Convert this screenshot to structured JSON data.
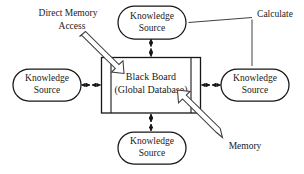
{
  "diagram": {
    "background_color": "#ffffff",
    "stroke_color": "#161616",
    "text_color": "#1a1a1a",
    "board": {
      "line1": "Black Board",
      "line2": "(Global Database)"
    },
    "nodes": {
      "top": {
        "line1": "Knowledge",
        "line2": "Source"
      },
      "left": {
        "line1": "Knowledge",
        "line2": "Source"
      },
      "right": {
        "line1": "Knowledge",
        "line2": "Source"
      },
      "bottom": {
        "line1": "Knowledge",
        "line2": "Source"
      }
    },
    "labels": {
      "direct_memory_access_line1": "Direct Memory",
      "direct_memory_access_line2": "Access",
      "calculate": "Calculate",
      "memory": "Memory"
    },
    "icons": {
      "dma_block_arrow": "block-arrow-down-right-icon",
      "memory_block_arrow": "block-arrow-up-left-icon",
      "top_connector": "double-arrow-vertical-icon",
      "left_connector": "double-arrow-horizontal-icon",
      "right_connector": "double-arrow-horizontal-icon",
      "bottom_connector": "double-arrow-vertical-icon",
      "calculate_leader": "leader-line-icon"
    }
  }
}
